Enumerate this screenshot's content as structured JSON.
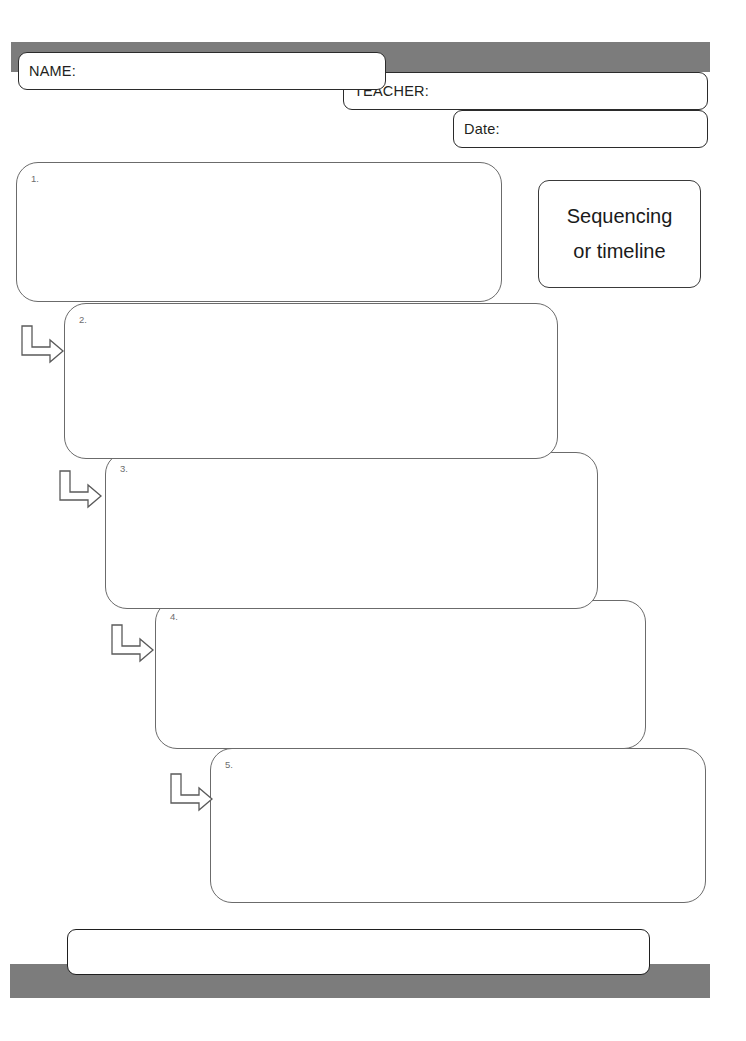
{
  "worksheet": {
    "title_card": {
      "line_1": "Sequencing",
      "line_2": "or timeline"
    },
    "header_fields": [
      {
        "label": "NAME:",
        "value": "",
        "name": "name-field"
      },
      {
        "label": "TEACHER:",
        "value": "",
        "name": "teacher-field"
      },
      {
        "label": "Date:",
        "value": "",
        "name": "date-field"
      }
    ],
    "steps": [
      {
        "number": "1.",
        "text": ""
      },
      {
        "number": "2.",
        "text": ""
      },
      {
        "number": "3.",
        "text": ""
      },
      {
        "number": "4.",
        "text": ""
      },
      {
        "number": "5.",
        "text": ""
      }
    ],
    "arrows": [
      {
        "icon": "elbow-arrow-icon"
      },
      {
        "icon": "elbow-arrow-icon"
      },
      {
        "icon": "elbow-arrow-icon"
      },
      {
        "icon": "elbow-arrow-icon"
      }
    ],
    "footer_box": {
      "text": ""
    },
    "colors": {
      "banner_gray": "#7c7c7c",
      "box_outline": "#6b6b6b",
      "field_outline": "#2b2b2b",
      "page_background": "#ffffff",
      "step_number_text": "#6d6d6d"
    }
  }
}
